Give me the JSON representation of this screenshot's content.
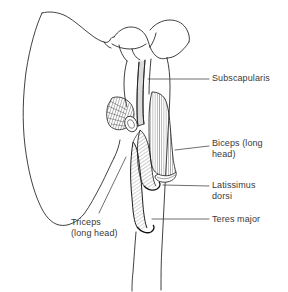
{
  "figure": {
    "kind": "anatomical-line-drawing",
    "view": "anterior",
    "background_color": "#ffffff",
    "line_color": "#1a1a1a",
    "text_color": "#3a3a3a",
    "leader_color": "#4a4a4a",
    "width": 288,
    "height": 292
  },
  "labels": {
    "subscapularis": "Subscapularis",
    "biceps": "Biceps (long\nhead)",
    "latissimus": "Latissimus\ndorsi",
    "teres": "Teres major",
    "triceps": "Triceps\n(long head)"
  },
  "leaders": [
    {
      "name": "leader-subscapularis",
      "x1": 148,
      "y1": 79,
      "x2": 209,
      "y2": 79
    },
    {
      "name": "leader-biceps",
      "x1": 175,
      "y1": 150,
      "x2": 209,
      "y2": 146
    },
    {
      "name": "leader-latissimus",
      "x1": 163,
      "y1": 185,
      "x2": 209,
      "y2": 186
    },
    {
      "name": "leader-teres",
      "x1": 152,
      "y1": 219,
      "x2": 209,
      "y2": 219
    },
    {
      "name": "leader-triceps",
      "x1": 99,
      "y1": 213,
      "x2": 126,
      "y2": 157
    }
  ],
  "structures": [
    "scapula-body",
    "scapular-spine",
    "acromion",
    "coracoid-process",
    "glenoid",
    "humerus-shaft",
    "humeral-head",
    "bicipital-groove",
    "subscapularis-tendon",
    "biceps-long-head-muscle",
    "latissimus-dorsi-tendon",
    "teres-major-tendon",
    "triceps-long-head-origin"
  ]
}
